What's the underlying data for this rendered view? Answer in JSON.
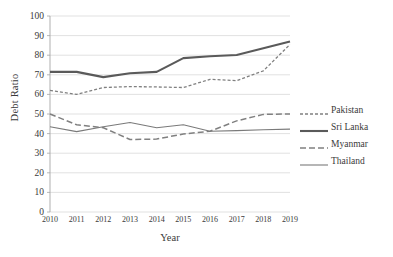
{
  "chart_data": {
    "type": "line",
    "title": "",
    "xlabel": "Year",
    "ylabel": "Debt Ratio",
    "x": [
      2010,
      2011,
      2012,
      2013,
      2014,
      2015,
      2016,
      2017,
      2018,
      2019
    ],
    "categories": [
      "2010",
      "2011",
      "2012",
      "2013",
      "2014",
      "2015",
      "2016",
      "2017",
      "2018",
      "2019"
    ],
    "xlim": [
      2010,
      2019
    ],
    "ylim": [
      0,
      100
    ],
    "yticks": [
      0,
      10,
      20,
      30,
      40,
      50,
      60,
      70,
      80,
      90,
      100
    ],
    "ytick_labels": [
      "0",
      "10",
      "20",
      "30",
      "40",
      "50",
      "60",
      "70",
      "80",
      "90",
      "100"
    ],
    "grid": "horizontal",
    "legend_position": "right",
    "series": [
      {
        "name": "Pakistan",
        "style": "dotted",
        "color": "#808080",
        "width": 1.3,
        "values": [
          62.0,
          60.0,
          63.5,
          64.0,
          63.8,
          63.5,
          67.7,
          67.0,
          72.0,
          85.5
        ]
      },
      {
        "name": "Sri Lanka",
        "style": "solid",
        "color": "#5a5a5a",
        "width": 2.1,
        "values": [
          71.5,
          71.5,
          68.8,
          70.8,
          71.5,
          78.5,
          79.5,
          80.1,
          83.5,
          87.0
        ]
      },
      {
        "name": "Myanmar",
        "style": "dashed",
        "color": "#808080",
        "width": 1.5,
        "values": [
          50.0,
          44.5,
          43.0,
          37.0,
          37.2,
          39.8,
          41.2,
          46.5,
          49.8,
          50.0
        ]
      },
      {
        "name": "Thailand",
        "style": "solid",
        "color": "#7a7a7a",
        "width": 1.1,
        "values": [
          43.5,
          41.0,
          43.5,
          45.7,
          43.0,
          44.5,
          41.2,
          41.5,
          42.0,
          42.3
        ]
      }
    ]
  },
  "axes": {
    "y_title": "Debt Ratio",
    "x_title": "Year"
  },
  "legend": {
    "items": [
      {
        "label": "Pakistan"
      },
      {
        "label": "Sri Lanka"
      },
      {
        "label": "Myanmar"
      },
      {
        "label": "Thailand"
      }
    ]
  },
  "colors": {
    "grid": "#d9d9d9",
    "axis": "#a6a6a6",
    "text": "#3a3a3a",
    "background": "#ffffff"
  }
}
